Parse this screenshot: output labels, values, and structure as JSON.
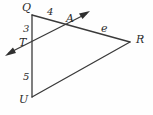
{
  "figure": {
    "width": 153,
    "height": 115,
    "background_color": "#fefefe",
    "stroke_color": "#3a3a3a",
    "label_color": "#2b2b2b",
    "vertex_labels": {
      "Q": "Q",
      "T": "T",
      "U": "U",
      "A": "A",
      "R": "R"
    },
    "segment_labels": {
      "QA": "4",
      "QT": "3",
      "TU": "5",
      "AR": "e"
    },
    "labels": [
      {
        "name": "vertex-label-Q",
        "text": "Q",
        "x": 22,
        "y": 2,
        "kind": "vertex"
      },
      {
        "name": "segment-label-4",
        "text": "4",
        "x": 47,
        "y": 7,
        "kind": "measure"
      },
      {
        "name": "vertex-label-A",
        "text": "A",
        "x": 66,
        "y": 13,
        "kind": "vertex"
      },
      {
        "name": "segment-label-3",
        "text": "3",
        "x": 23,
        "y": 24,
        "kind": "measure"
      },
      {
        "name": "segment-label-e",
        "text": "e",
        "x": 101,
        "y": 23,
        "kind": "measure"
      },
      {
        "name": "vertex-label-T",
        "text": "T",
        "x": 19,
        "y": 37,
        "kind": "vertex"
      },
      {
        "name": "vertex-label-R",
        "text": "R",
        "x": 136,
        "y": 34,
        "kind": "vertex"
      },
      {
        "name": "segment-label-5",
        "text": "5",
        "x": 23,
        "y": 72,
        "kind": "measure"
      },
      {
        "name": "vertex-label-U",
        "text": "U",
        "x": 19,
        "y": 94,
        "kind": "vertex"
      }
    ],
    "geometry": {
      "points": {
        "Q": [
          32,
          15
        ],
        "T": [
          32,
          45
        ],
        "U": [
          32,
          97
        ],
        "A": [
          72,
          25
        ],
        "R": [
          130,
          42
        ],
        "ray_tail": [
          6,
          55
        ],
        "ray_head": [
          89,
          12
        ]
      },
      "segments": [
        {
          "name": "segment-QU",
          "from": "Q",
          "to": "U"
        },
        {
          "name": "segment-QR",
          "from": "Q",
          "to": "R"
        },
        {
          "name": "segment-UR",
          "from": "U",
          "to": "R"
        }
      ],
      "double_arrow_line": {
        "name": "transversal-ray",
        "from": "ray_tail",
        "to": "ray_head",
        "arrowheads": [
          "start",
          "end"
        ]
      }
    }
  }
}
